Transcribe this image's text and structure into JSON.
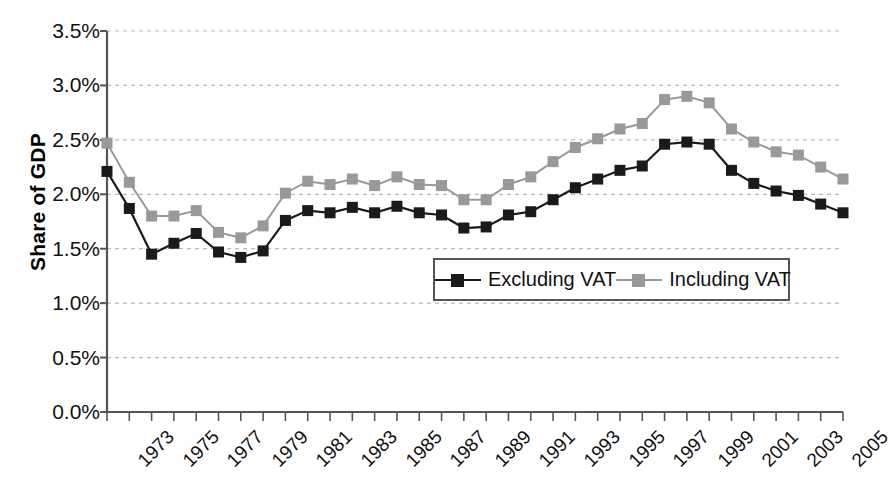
{
  "chart_data": {
    "type": "line",
    "title": "",
    "xlabel": "",
    "ylabel": "Share of GDP",
    "ylim": [
      0.0,
      3.5
    ],
    "ytick_labels": [
      "0.0%",
      "0.5%",
      "1.0%",
      "1.5%",
      "2.0%",
      "2.5%",
      "3.0%",
      "3.5%"
    ],
    "ytick_values": [
      0.0,
      0.5,
      1.0,
      1.5,
      2.0,
      2.5,
      3.0,
      3.5
    ],
    "grid": "horizontal-dashed",
    "legend_position": "inside-center-right",
    "x": [
      1973,
      1974,
      1975,
      1976,
      1977,
      1978,
      1979,
      1980,
      1981,
      1982,
      1983,
      1984,
      1985,
      1986,
      1987,
      1988,
      1989,
      1990,
      1991,
      1992,
      1993,
      1994,
      1995,
      1996,
      1997,
      1998,
      1999,
      2000,
      2001,
      2002,
      2003,
      2004,
      2005,
      2006
    ],
    "xtick_labels": [
      "1973",
      "1975",
      "1977",
      "1979",
      "1981",
      "1983",
      "1985",
      "1987",
      "1989",
      "1991",
      "1993",
      "1995",
      "1997",
      "1999",
      "2001",
      "2003",
      "2005"
    ],
    "xtick_values": [
      1973,
      1975,
      1977,
      1979,
      1981,
      1983,
      1985,
      1987,
      1989,
      1991,
      1993,
      1995,
      1997,
      1999,
      2001,
      2003,
      2005
    ],
    "xlim": [
      1973,
      2006
    ],
    "series": [
      {
        "name": "Excluding VAT",
        "color": "#1a1a1a",
        "marker": "square",
        "values": [
          2.21,
          1.87,
          1.45,
          1.55,
          1.64,
          1.47,
          1.42,
          1.48,
          1.76,
          1.85,
          1.83,
          1.88,
          1.83,
          1.89,
          1.83,
          1.81,
          1.69,
          1.7,
          1.81,
          1.84,
          1.95,
          2.06,
          2.14,
          2.22,
          2.26,
          2.46,
          2.48,
          2.46,
          2.22,
          2.1,
          2.03,
          1.99,
          1.91,
          1.83
        ]
      },
      {
        "name": "Including VAT",
        "color": "#999999",
        "marker": "square",
        "values": [
          2.47,
          2.11,
          1.8,
          1.8,
          1.85,
          1.65,
          1.6,
          1.71,
          2.01,
          2.12,
          2.09,
          2.14,
          2.08,
          2.16,
          2.09,
          2.08,
          1.95,
          1.95,
          2.09,
          2.16,
          2.3,
          2.43,
          2.51,
          2.6,
          2.65,
          2.87,
          2.9,
          2.84,
          2.6,
          2.48,
          2.39,
          2.36,
          2.25,
          2.14
        ]
      }
    ]
  },
  "axis": {
    "y_title": "Share of GDP"
  },
  "legend": {
    "items": [
      {
        "label": "Excluding VAT",
        "color": "#1a1a1a"
      },
      {
        "label": "Including VAT",
        "color": "#999999"
      }
    ]
  },
  "colors": {
    "excluding_vat": "#1a1a1a",
    "including_vat": "#999999",
    "axis": "#555555",
    "grid": "#bbbbbb",
    "background": "#ffffff"
  }
}
